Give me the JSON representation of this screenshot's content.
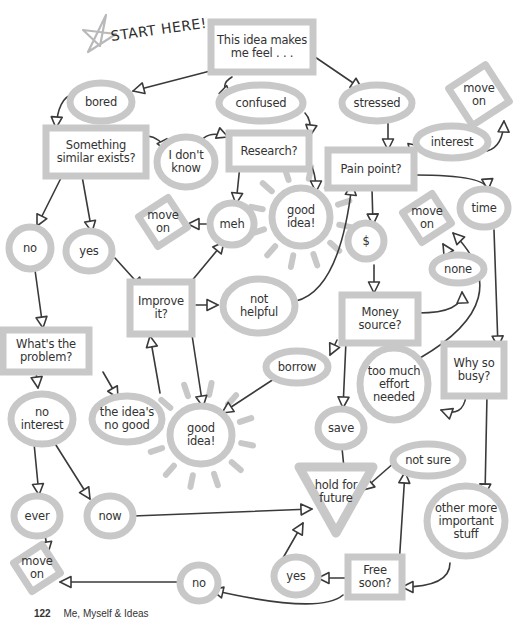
{
  "title": "START HERE!",
  "colors": {
    "shape_fill": "#c8c8c8",
    "line": "#3a3a3a",
    "text": "#333333",
    "star": "#b9b9b9"
  },
  "footer": {
    "page_number": "122",
    "book_title": "Me, Myself & Ideas"
  },
  "nodes": [
    {
      "id": "start",
      "shape": "rect",
      "label": "This idea makes\nme feel . . .",
      "x": 262,
      "y": 47,
      "w": 102,
      "h": 50
    },
    {
      "id": "bored",
      "shape": "ellipse",
      "label": "bored",
      "x": 101,
      "y": 102,
      "w": 62,
      "h": 38
    },
    {
      "id": "confused",
      "shape": "ellipse",
      "label": "confused",
      "x": 261,
      "y": 103,
      "w": 84,
      "h": 36
    },
    {
      "id": "stressed",
      "shape": "ellipse",
      "label": "stressed",
      "x": 377,
      "y": 103,
      "w": 70,
      "h": 36
    },
    {
      "id": "moveon1",
      "shape": "diamond",
      "label": "move\non",
      "x": 479,
      "y": 95,
      "w": 62,
      "h": 62
    },
    {
      "id": "similar",
      "shape": "rect",
      "label": "Something\nsimilar exists?",
      "x": 96,
      "y": 152,
      "w": 100,
      "h": 48
    },
    {
      "id": "dontknow",
      "shape": "ellipse",
      "label": "I don't\nknow",
      "x": 186,
      "y": 162,
      "w": 58,
      "h": 50
    },
    {
      "id": "research",
      "shape": "rect",
      "label": "Research?",
      "x": 269,
      "y": 151,
      "w": 80,
      "h": 36
    },
    {
      "id": "interest",
      "shape": "ellipse",
      "label": "interest",
      "x": 452,
      "y": 142,
      "w": 72,
      "h": 32
    },
    {
      "id": "painpoint",
      "shape": "rect",
      "label": "Pain point?",
      "x": 371,
      "y": 169,
      "w": 86,
      "h": 38
    },
    {
      "id": "moveon2",
      "shape": "diamond",
      "label": "move\non",
      "x": 163,
      "y": 222,
      "w": 50,
      "h": 50
    },
    {
      "id": "meh",
      "shape": "ellipse",
      "label": "meh",
      "x": 232,
      "y": 224,
      "w": 44,
      "h": 42
    },
    {
      "id": "goodidea1",
      "shape": "ellipse",
      "label": "good\nidea!",
      "x": 301,
      "y": 217,
      "w": 58,
      "h": 58,
      "sun": true
    },
    {
      "id": "dollar",
      "shape": "ellipse",
      "label": "$",
      "x": 366,
      "y": 241,
      "w": 36,
      "h": 36
    },
    {
      "id": "moveon3",
      "shape": "diamond",
      "label": "move\non",
      "x": 427,
      "y": 218,
      "w": 50,
      "h": 50
    },
    {
      "id": "time",
      "shape": "ellipse",
      "label": "time",
      "x": 484,
      "y": 208,
      "w": 48,
      "h": 38
    },
    {
      "id": "no1",
      "shape": "ellipse",
      "label": "no",
      "x": 30,
      "y": 248,
      "w": 42,
      "h": 42
    },
    {
      "id": "yes1",
      "shape": "ellipse",
      "label": "yes",
      "x": 89,
      "y": 251,
      "w": 46,
      "h": 40
    },
    {
      "id": "none",
      "shape": "ellipse",
      "label": "none",
      "x": 458,
      "y": 269,
      "w": 52,
      "h": 28
    },
    {
      "id": "improve",
      "shape": "rect",
      "label": "Improve\nit?",
      "x": 161,
      "y": 308,
      "w": 62,
      "h": 52
    },
    {
      "id": "nothelpful",
      "shape": "ellipse",
      "label": "not\nhelpful",
      "x": 259,
      "y": 306,
      "w": 72,
      "h": 54
    },
    {
      "id": "money",
      "shape": "rect",
      "label": "Money\nsource?",
      "x": 380,
      "y": 319,
      "w": 76,
      "h": 48
    },
    {
      "id": "problem",
      "shape": "rect",
      "label": "What's the\nproblem?",
      "x": 46,
      "y": 351,
      "w": 86,
      "h": 42
    },
    {
      "id": "borrow",
      "shape": "ellipse",
      "label": "borrow",
      "x": 297,
      "y": 367,
      "w": 62,
      "h": 32
    },
    {
      "id": "toomuch",
      "shape": "ellipse",
      "label": "too much\neffort\nneeded",
      "x": 394,
      "y": 384,
      "w": 68,
      "h": 72
    },
    {
      "id": "whybusy",
      "shape": "rect",
      "label": "Why so\nbusy?",
      "x": 474,
      "y": 370,
      "w": 60,
      "h": 52
    },
    {
      "id": "nointerest",
      "shape": "ellipse",
      "label": "no\ninterest",
      "x": 42,
      "y": 419,
      "w": 62,
      "h": 50
    },
    {
      "id": "ideanogood",
      "shape": "ellipse",
      "label": "the idea's\nno good",
      "x": 127,
      "y": 419,
      "w": 70,
      "h": 46
    },
    {
      "id": "goodidea2",
      "shape": "ellipse",
      "label": "good\nidea!",
      "x": 201,
      "y": 435,
      "w": 62,
      "h": 58,
      "sun": true
    },
    {
      "id": "save",
      "shape": "ellipse",
      "label": "save",
      "x": 341,
      "y": 428,
      "w": 46,
      "h": 38
    },
    {
      "id": "notsure",
      "shape": "ellipse",
      "label": "not sure",
      "x": 428,
      "y": 460,
      "w": 70,
      "h": 32
    },
    {
      "id": "holdfuture",
      "shape": "triangle",
      "label": "hold for\nfuture",
      "x": 336,
      "y": 500,
      "w": 74,
      "h": 66
    },
    {
      "id": "otherstuff",
      "shape": "ellipse",
      "label": "other more\nimportant\nstuff",
      "x": 466,
      "y": 521,
      "w": 78,
      "h": 70
    },
    {
      "id": "ever",
      "shape": "ellipse",
      "label": "ever",
      "x": 37,
      "y": 516,
      "w": 46,
      "h": 40
    },
    {
      "id": "now",
      "shape": "ellipse",
      "label": "now",
      "x": 110,
      "y": 516,
      "w": 46,
      "h": 40
    },
    {
      "id": "moveon4",
      "shape": "diamond",
      "label": "move\non",
      "x": 37,
      "y": 568,
      "w": 48,
      "h": 48
    },
    {
      "id": "no2",
      "shape": "ellipse",
      "label": "no",
      "x": 199,
      "y": 583,
      "w": 38,
      "h": 36
    },
    {
      "id": "yes2",
      "shape": "ellipse",
      "label": "yes",
      "x": 296,
      "y": 576,
      "w": 44,
      "h": 38
    },
    {
      "id": "freesoon",
      "shape": "rect",
      "label": "Free\nsoon?",
      "x": 375,
      "y": 577,
      "w": 54,
      "h": 40
    }
  ],
  "edges": [
    {
      "from": [
        214,
        70
      ],
      "to": [
        133,
        91
      ]
    },
    {
      "from": [
        232,
        77
      ],
      "to": [
        231,
        97
      ],
      "curve": [
        218,
        85
      ]
    },
    {
      "from": [
        315,
        57
      ],
      "to": [
        362,
        89
      ]
    },
    {
      "from": [
        73,
        94
      ],
      "to": [
        56,
        128
      ],
      "curve": [
        58,
        98
      ]
    },
    {
      "from": [
        147,
        136
      ],
      "to": [
        167,
        151
      ],
      "curve": [
        160,
        137
      ]
    },
    {
      "from": [
        197,
        148
      ],
      "to": [
        228,
        137
      ],
      "curve": [
        205,
        128
      ]
    },
    {
      "from": [
        305,
        113
      ],
      "to": [
        310,
        136
      ],
      "curve": [
        312,
        120
      ]
    },
    {
      "from": [
        388,
        123
      ],
      "to": [
        388,
        150
      ]
    },
    {
      "from": [
        399,
        161
      ],
      "to": [
        420,
        146
      ],
      "curve": [
        405,
        150
      ]
    },
    {
      "from": [
        487,
        151
      ],
      "to": [
        504,
        121
      ],
      "curve": [
        503,
        147
      ]
    },
    {
      "from": [
        415,
        175
      ],
      "to": [
        488,
        190
      ],
      "curve": [
        487,
        175
      ]
    },
    {
      "from": [
        62,
        176
      ],
      "to": [
        37,
        226
      ]
    },
    {
      "from": [
        82,
        176
      ],
      "to": [
        92,
        232
      ]
    },
    {
      "from": [
        240,
        165
      ],
      "to": [
        236,
        204
      ]
    },
    {
      "from": [
        305,
        160
      ],
      "to": [
        316,
        192
      ],
      "curve": [
        316,
        165
      ]
    },
    {
      "from": [
        212,
        224
      ],
      "to": [
        188,
        224
      ]
    },
    {
      "from": [
        372,
        189
      ],
      "to": [
        373,
        225
      ]
    },
    {
      "from": [
        115,
        258
      ],
      "to": [
        143,
        289
      ]
    },
    {
      "from": [
        190,
        283
      ],
      "to": [
        224,
        242
      ]
    },
    {
      "from": [
        196,
        305
      ],
      "to": [
        218,
        305
      ]
    },
    {
      "from": [
        296,
        301
      ],
      "to": [
        352,
        184
      ],
      "curve": [
        340,
        290
      ]
    },
    {
      "from": [
        374,
        265
      ],
      "to": [
        374,
        293
      ]
    },
    {
      "from": [
        418,
        313
      ],
      "to": [
        462,
        292
      ],
      "curve": [
        463,
        313
      ]
    },
    {
      "from": [
        454,
        262
      ],
      "to": [
        443,
        244
      ]
    },
    {
      "from": [
        420,
        358
      ],
      "to": [
        453,
        233
      ],
      "curve": [
        520,
        300
      ]
    },
    {
      "from": [
        494,
        230
      ],
      "to": [
        498,
        347
      ]
    },
    {
      "from": [
        35,
        270
      ],
      "to": [
        43,
        328
      ]
    },
    {
      "from": [
        160,
        393
      ],
      "to": [
        150,
        336
      ]
    },
    {
      "from": [
        192,
        335
      ],
      "to": [
        203,
        407
      ]
    },
    {
      "from": [
        337,
        340
      ],
      "to": [
        330,
        355
      ]
    },
    {
      "from": [
        277,
        377
      ],
      "to": [
        222,
        413
      ]
    },
    {
      "from": [
        346,
        341
      ],
      "to": [
        343,
        408
      ]
    },
    {
      "from": [
        466,
        396
      ],
      "to": [
        441,
        410
      ],
      "curve": [
        463,
        418
      ]
    },
    {
      "from": [
        36,
        372
      ],
      "to": [
        38,
        388
      ]
    },
    {
      "from": [
        103,
        372
      ],
      "to": [
        118,
        398
      ]
    },
    {
      "from": [
        34,
        443
      ],
      "to": [
        39,
        495
      ]
    },
    {
      "from": [
        54,
        442
      ],
      "to": [
        90,
        499
      ]
    },
    {
      "from": [
        487,
        395
      ],
      "to": [
        485,
        495
      ]
    },
    {
      "from": [
        342,
        448
      ],
      "to": [
        345,
        478
      ]
    },
    {
      "from": [
        395,
        462
      ],
      "to": [
        363,
        490
      ]
    },
    {
      "from": [
        133,
        516
      ],
      "to": [
        312,
        509
      ]
    },
    {
      "from": [
        45,
        535
      ],
      "to": [
        48,
        553
      ]
    },
    {
      "from": [
        283,
        558
      ],
      "to": [
        303,
        523
      ]
    },
    {
      "from": [
        347,
        578
      ],
      "to": [
        318,
        578
      ]
    },
    {
      "from": [
        399,
        566
      ],
      "to": [
        405,
        472
      ]
    },
    {
      "from": [
        450,
        563
      ],
      "to": [
        402,
        587
      ],
      "curve": [
        450,
        587
      ]
    },
    {
      "from": [
        181,
        582
      ],
      "to": [
        60,
        582
      ]
    },
    {
      "from": [
        343,
        595
      ],
      "to": [
        212,
        590
      ],
      "curve": [
        320,
        615
      ]
    }
  ]
}
